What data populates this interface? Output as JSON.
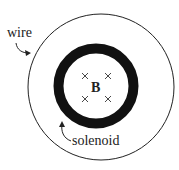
{
  "diagram": {
    "labels": {
      "wire": "wire",
      "solenoid": "solenoid",
      "field": "B"
    },
    "field_markers": [
      "×",
      "×",
      "×",
      "×"
    ],
    "colors": {
      "stroke": "#111111",
      "background": "#ffffff"
    }
  }
}
